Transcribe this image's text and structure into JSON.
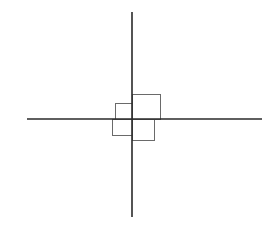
{
  "diagram": {
    "canvas": {
      "width": 277,
      "height": 239,
      "background": "#ffffff"
    },
    "axes": {
      "color": "#2a2a2a",
      "stroke_width": 1.6,
      "origin": {
        "x": 132,
        "y": 119
      },
      "horizontal": {
        "x1": 27,
        "x2": 262,
        "y": 119
      },
      "vertical": {
        "x": 132,
        "y1": 12,
        "y2": 217
      }
    },
    "boxes": {
      "color": "#6a6a6a",
      "stroke_width": 1,
      "items": [
        {
          "name": "quadrant-top-right-box",
          "x1": 132,
          "y1": 94,
          "x2": 160,
          "y2": 119
        },
        {
          "name": "quadrant-top-left-box",
          "x1": 115,
          "y1": 103,
          "x2": 132,
          "y2": 119
        },
        {
          "name": "quadrant-bottom-left-box",
          "x1": 112,
          "y1": 119,
          "x2": 132,
          "y2": 135
        },
        {
          "name": "quadrant-bottom-right-box",
          "x1": 132,
          "y1": 119,
          "x2": 154,
          "y2": 140
        }
      ]
    }
  }
}
